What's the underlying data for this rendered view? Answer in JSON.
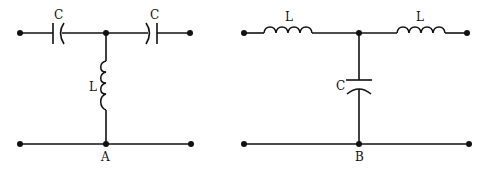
{
  "circuits": [
    {
      "id": "A",
      "label": "A",
      "topology": "T-network high-pass",
      "components": [
        {
          "type": "capacitor",
          "label": "C",
          "position": "series-left"
        },
        {
          "type": "capacitor",
          "label": "C",
          "position": "series-right"
        },
        {
          "type": "inductor",
          "label": "L",
          "position": "shunt"
        }
      ]
    },
    {
      "id": "B",
      "label": "B",
      "topology": "T-network low-pass",
      "components": [
        {
          "type": "inductor",
          "label": "L",
          "position": "series-left"
        },
        {
          "type": "inductor",
          "label": "L",
          "position": "series-right"
        },
        {
          "type": "capacitor",
          "label": "C",
          "position": "shunt"
        }
      ]
    }
  ]
}
